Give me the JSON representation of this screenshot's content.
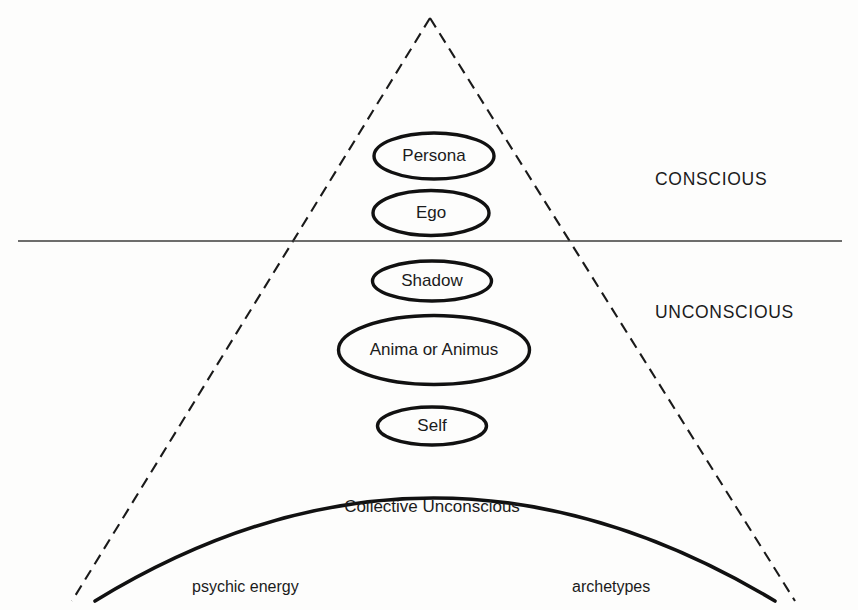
{
  "diagram": {
    "background_color": "#fdfdfc",
    "line_color": "#111111",
    "canvas": {
      "width": 858,
      "height": 610
    },
    "regions": [
      {
        "id": "conscious",
        "label": "CONSCIOUS",
        "x": 655,
        "y": 185
      },
      {
        "id": "unconscious",
        "label": "UNCONSCIOUS",
        "x": 655,
        "y": 318
      }
    ],
    "divider": {
      "y": 241,
      "x1": 18,
      "x2": 842
    },
    "triangle": {
      "apex_x": 430,
      "apex_y": 18,
      "left_x": 72,
      "right_x": 795,
      "base_y": 601,
      "style": "dashed"
    },
    "arc": {
      "label": "Collective Unconscious",
      "label_x": 432,
      "label_y": 512,
      "start_x": 95,
      "start_y": 601,
      "end_x": 775,
      "end_y": 601,
      "apex_x": 432,
      "apex_y": 459
    },
    "ellipses": [
      {
        "id": "persona",
        "label": "Persona",
        "cx": 434,
        "cy": 156,
        "rx": 60,
        "ry": 23
      },
      {
        "id": "ego",
        "label": "Ego",
        "cx": 431,
        "cy": 213,
        "rx": 58,
        "ry": 22.5
      },
      {
        "id": "shadow",
        "label": "Shadow",
        "cx": 432,
        "cy": 281,
        "rx": 59.5,
        "ry": 20
      },
      {
        "id": "anima-animus",
        "label": "Anima or Animus",
        "cx": 434,
        "cy": 350,
        "rx": 95.5,
        "ry": 34.5
      },
      {
        "id": "self",
        "label": "Self",
        "cx": 432,
        "cy": 426,
        "rx": 54.5,
        "ry": 19
      }
    ],
    "footer_labels": [
      {
        "id": "psychic-energy",
        "label": "psychic energy",
        "x": 192,
        "y": 592
      },
      {
        "id": "archetypes",
        "label": "archetypes",
        "x": 572,
        "y": 592
      }
    ]
  }
}
